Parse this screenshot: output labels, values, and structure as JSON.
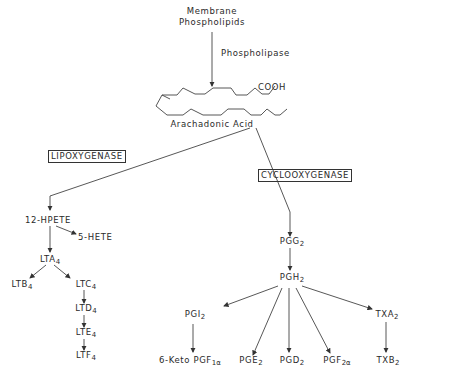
{
  "source": {
    "line1": "Membrane",
    "line2": "Phospholipids",
    "enzyme": "Phospholipase"
  },
  "substrate": {
    "name": "Arachadonic Acid",
    "group": "COOH"
  },
  "enzymes": {
    "lipoxygenase": "LIPOXYGENASE",
    "cyclooxygenase": "CYCLOOXYGENASE"
  },
  "lipoxygenase_branch": {
    "hpete": "12-HPETE",
    "hete": "5-HETE",
    "lta": {
      "base": "LTA",
      "sub": "4"
    },
    "ltb": {
      "base": "LTB",
      "sub": "4"
    },
    "ltc": {
      "base": "LTC",
      "sub": "4"
    },
    "ltd": {
      "base": "LTD",
      "sub": "4"
    },
    "lte": {
      "base": "LTE",
      "sub": "4"
    },
    "ltf": {
      "base": "LTF",
      "sub": "4"
    }
  },
  "cyclooxygenase_branch": {
    "pgg": {
      "base": "PGG",
      "sub": "2"
    },
    "pgh": {
      "base": "PGH",
      "sub": "2"
    },
    "pgi": {
      "base": "PGI",
      "sub": "2"
    },
    "txa": {
      "base": "TXA",
      "sub": "2"
    },
    "keto": {
      "base": "6-Keto PGF",
      "sub": "1α"
    },
    "pge": {
      "base": "PGE",
      "sub": "2"
    },
    "pgd": {
      "base": "PGD",
      "sub": "2"
    },
    "pgf": {
      "base": "PGF",
      "sub": "2α"
    },
    "txb": {
      "base": "TXB",
      "sub": "2"
    }
  }
}
